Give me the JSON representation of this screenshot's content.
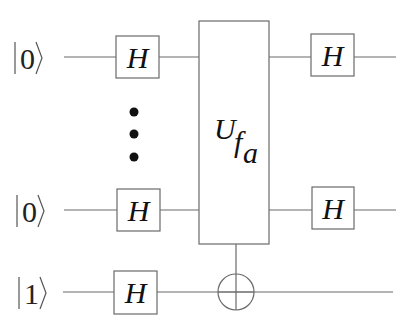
{
  "diagram": {
    "type": "quantum-circuit",
    "name": "Bernstein-Vazirani / Deutsch-Jozsa style circuit",
    "qubits": [
      {
        "id": "q0",
        "initial_state": "0",
        "ket_label": "|0⟩"
      },
      {
        "id": "ellipsis",
        "initial_state": "⋮"
      },
      {
        "id": "qn",
        "initial_state": "0",
        "ket_label": "|0⟩"
      },
      {
        "id": "ancilla",
        "initial_state": "1",
        "ket_label": "|1⟩"
      }
    ],
    "gates": {
      "hadamard_label": "H",
      "oracle": {
        "main": "U",
        "sub1": "f",
        "sub2": "a"
      },
      "target": "⊕"
    },
    "colors": {
      "line": "#6a6a6a",
      "text": "#111111",
      "background": "#ffffff"
    }
  }
}
